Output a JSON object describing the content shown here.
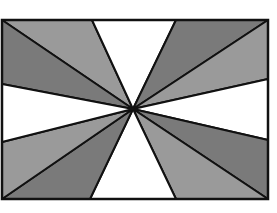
{
  "figure": {
    "frame": {
      "x1": 2,
      "y1": 20,
      "x2": 268,
      "y2": 199
    },
    "center": {
      "x": 133,
      "y": 109
    },
    "colors": {
      "light_gray": "#9a9a9a",
      "dark_gray": "#7a7a7a",
      "white": "#ffffff",
      "stroke": "#111111"
    },
    "wedges": [
      {
        "name": "top-left-upper",
        "shade": "light",
        "points": [
          [
            2,
            20
          ],
          [
            92,
            20
          ]
        ]
      },
      {
        "name": "top-left-lower",
        "shade": "dark",
        "points": [
          [
            2,
            20
          ],
          [
            2,
            84
          ]
        ]
      },
      {
        "name": "top-white",
        "shade": "white",
        "points": [
          [
            92,
            20
          ],
          [
            176,
            20
          ]
        ]
      },
      {
        "name": "top-right-upper",
        "shade": "dark",
        "points": [
          [
            176,
            20
          ],
          [
            268,
            20
          ]
        ]
      },
      {
        "name": "top-right-lower",
        "shade": "light",
        "points": [
          [
            268,
            20
          ],
          [
            268,
            79
          ]
        ]
      },
      {
        "name": "right-white",
        "shade": "white",
        "points": [
          [
            268,
            79
          ],
          [
            268,
            140
          ]
        ]
      },
      {
        "name": "bottom-right-upper",
        "shade": "dark",
        "points": [
          [
            268,
            140
          ],
          [
            268,
            199
          ]
        ]
      },
      {
        "name": "bottom-right-lower",
        "shade": "light",
        "points": [
          [
            268,
            199
          ],
          [
            176,
            199
          ]
        ]
      },
      {
        "name": "bottom-white",
        "shade": "white",
        "points": [
          [
            176,
            199
          ],
          [
            90,
            199
          ]
        ]
      },
      {
        "name": "bottom-left-lower",
        "shade": "dark",
        "points": [
          [
            90,
            199
          ],
          [
            2,
            199
          ]
        ]
      },
      {
        "name": "bottom-left-upper",
        "shade": "light",
        "points": [
          [
            2,
            199
          ],
          [
            2,
            142
          ]
        ]
      },
      {
        "name": "left-white",
        "shade": "white",
        "points": [
          [
            2,
            142
          ],
          [
            2,
            84
          ]
        ]
      }
    ]
  }
}
